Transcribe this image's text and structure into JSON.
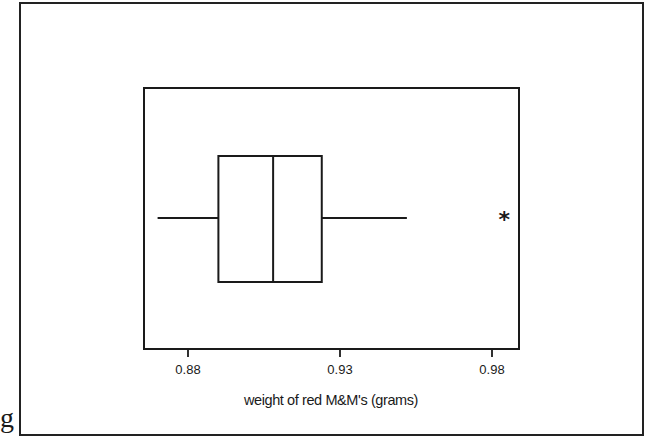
{
  "side_text": "g",
  "chart_data": {
    "type": "boxplot",
    "title": "",
    "xlabel": "weight of red M&M's (grams)",
    "ylabel": "",
    "orientation": "horizontal",
    "xlim": [
      0.8665,
      0.99
    ],
    "xticks": [
      0.88,
      0.93,
      0.98
    ],
    "xtick_labels": [
      "0.88",
      "0.93",
      "0.98"
    ],
    "grid": false,
    "legend": null,
    "series": [
      {
        "name": "weight of red M&M's (grams)",
        "whisker_low": 0.87,
        "q1": 0.89,
        "median": 0.908,
        "q3": 0.924,
        "whisker_high": 0.952,
        "outliers": [
          0.984
        ],
        "outlier_marker": "*"
      }
    ]
  },
  "colors": {
    "line": "#1a1a1a",
    "background": "#ffffff"
  }
}
